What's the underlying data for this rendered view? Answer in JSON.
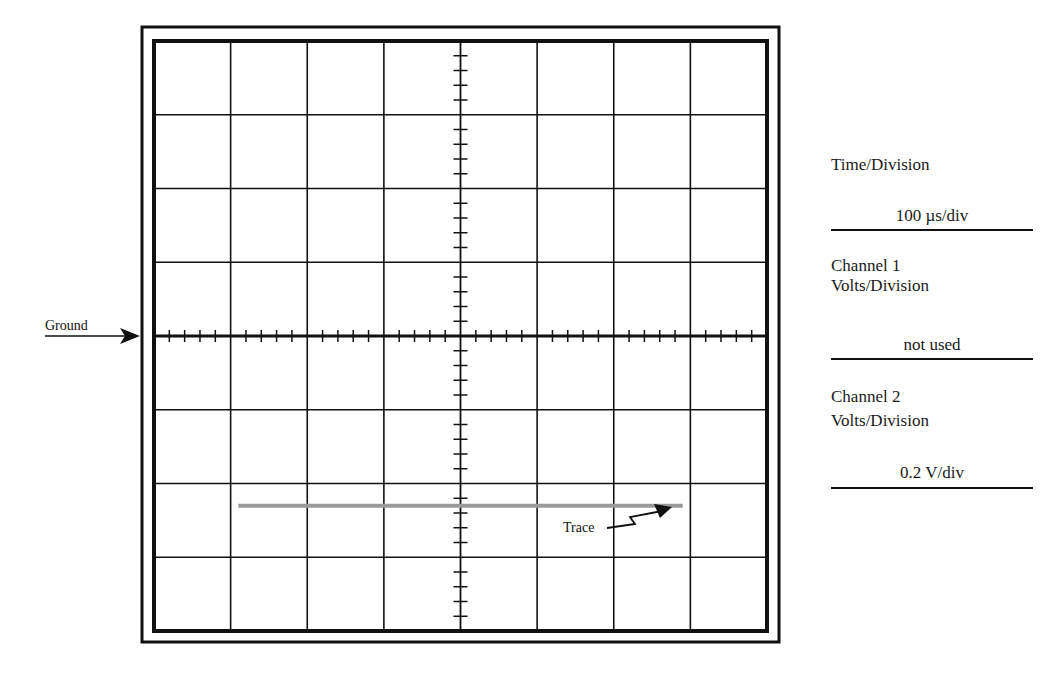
{
  "figure": {
    "ground_label": "Ground",
    "trace_label": "Trace",
    "grid": {
      "horizontal_divisions": 8,
      "vertical_divisions": 8,
      "minor_ticks_per_division": 5
    },
    "trace": {
      "level_divisions": -2.3,
      "start_division": -2.9,
      "end_division": 2.9,
      "color": "#9a9a9a"
    }
  },
  "settings": {
    "time_division": {
      "label": "Time/Division",
      "value": "100 µs/div"
    },
    "channel1": {
      "label_line1": "Channel 1",
      "label_line2": "Volts/Division",
      "value": "not used"
    },
    "channel2": {
      "label_line1": "Channel 2",
      "label_line2": "Volts/Division",
      "value": "0.2 V/div"
    }
  }
}
